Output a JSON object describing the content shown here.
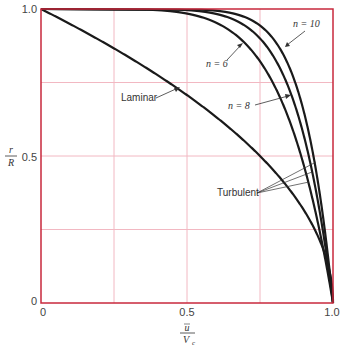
{
  "chart_data": {
    "type": "line",
    "title": "",
    "xlabel": "ū / V_c",
    "ylabel": "r / R",
    "xlim": [
      0,
      1.0
    ],
    "ylim": [
      0,
      1.0
    ],
    "grid": true,
    "x_ticks": [
      "0",
      "0.5",
      "1.0"
    ],
    "y_ticks": [
      "0",
      "0.5",
      "1.0"
    ],
    "series": [
      {
        "name": "Laminar",
        "formula": "r/R = sqrt(1 - u/Vc)",
        "x": [
          0,
          0.1,
          0.2,
          0.3,
          0.4,
          0.5,
          0.6,
          0.7,
          0.8,
          0.9,
          0.95,
          1.0
        ],
        "y": [
          1.0,
          0.949,
          0.894,
          0.837,
          0.775,
          0.707,
          0.632,
          0.548,
          0.447,
          0.316,
          0.224,
          0
        ]
      },
      {
        "name": "Turbulent n = 6",
        "formula": "r/R = 1 - (u/Vc)^6",
        "x": [
          0,
          0.5,
          0.6,
          0.7,
          0.8,
          0.9,
          0.95,
          1.0
        ],
        "y": [
          1.0,
          0.984,
          0.953,
          0.882,
          0.738,
          0.469,
          0.265,
          0
        ]
      },
      {
        "name": "Turbulent n = 8",
        "formula": "r/R = 1 - (u/Vc)^8",
        "x": [
          0,
          0.5,
          0.6,
          0.7,
          0.8,
          0.9,
          0.95,
          1.0
        ],
        "y": [
          1.0,
          0.996,
          0.983,
          0.942,
          0.832,
          0.57,
          0.337,
          0
        ]
      },
      {
        "name": "Turbulent n = 10",
        "formula": "r/R = 1 - (u/Vc)^10",
        "x": [
          0,
          0.5,
          0.6,
          0.7,
          0.8,
          0.9,
          0.95,
          1.0
        ],
        "y": [
          1.0,
          0.999,
          0.994,
          0.972,
          0.893,
          0.651,
          0.401,
          0
        ]
      }
    ],
    "annotations": [
      "Laminar",
      "n = 6",
      "n = 8",
      "n = 10",
      "Turbulent"
    ]
  },
  "labels": {
    "laminar": "Laminar",
    "turbulent": "Turbulent",
    "n6": "n = 6",
    "n8": "n = 8",
    "n10": "n = 10",
    "x_num": "u",
    "x_den": "V",
    "x_den_sub": "c",
    "y_num": "r",
    "y_den": "R",
    "xt0": "0",
    "xt05": "0.5",
    "xt1": "1.0",
    "yt0": "0",
    "yt05": "0.5",
    "yt1": "1.0"
  },
  "colors": {
    "frame": "#c8283c",
    "grid": "#f2b8c2",
    "curve": "#1a1a1a"
  }
}
